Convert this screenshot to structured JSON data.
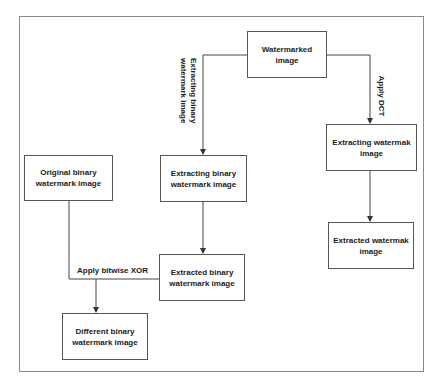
{
  "diagram": {
    "nodes": {
      "watermarked": {
        "label": "Watermarked image"
      },
      "extracting_binary": {
        "label": "Extracting binary watermark image"
      },
      "original_binary": {
        "label": "Original binary watermark image"
      },
      "extracted_binary": {
        "label": "Extracted binary watermark image"
      },
      "different_binary": {
        "label": "Different binary watermark image"
      },
      "extracting_watermak": {
        "label": "Extracting watermak image"
      },
      "extracted_watermak": {
        "label": "Extracted  watermak image"
      }
    },
    "edges": {
      "left_branch": {
        "label_line1": "Extracting binary",
        "label_line2": "watermark  image"
      },
      "right_branch": {
        "label": "Apply DCT"
      },
      "xor": {
        "label": "Apply bitwise XOR"
      }
    },
    "colors": {
      "line": "#444444",
      "frame": "#8a8a8a",
      "text": "#222222"
    }
  }
}
